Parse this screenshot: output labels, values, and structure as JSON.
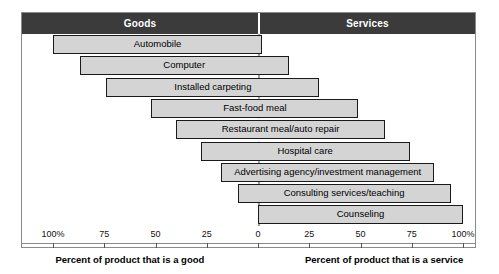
{
  "header": {
    "left_label": "Goods",
    "right_label": "Services"
  },
  "axis": {
    "ticks_left": [
      "100%",
      "75",
      "50",
      "25"
    ],
    "zero": "0",
    "ticks_right": [
      "25",
      "50",
      "75",
      "100%"
    ],
    "caption_left": "Percent of product that is a good",
    "caption_right": "Percent of product that is a service"
  },
  "colors": {
    "header_band": "#3b3b3b",
    "bar_fill": "#d4d4d4",
    "bar_border": "#1a1a1a",
    "zero_line": "#9c9c9c",
    "frame": "#8a8a8a"
  },
  "chart_data": {
    "type": "bar",
    "title": "",
    "subtitle": "",
    "xlabel": "Percent of product that is a good / Percent of product that is a service",
    "ylabel": "",
    "xlim": [
      -100,
      100
    ],
    "grid": false,
    "legend": "none",
    "orientation": "horizontal",
    "note": "Each bar is a product spanning from its percent-good (left of 0) to its percent-service (right of 0).",
    "categories": [
      "Automobile",
      "Computer",
      "Installed carpeting",
      "Fast-food meal",
      "Restaurant meal/auto repair",
      "Hospital care",
      "Advertising agency/investment management",
      "Consulting services/teaching",
      "Counseling"
    ],
    "series": [
      {
        "name": "percent_good",
        "values": [
          100,
          87,
          74,
          52,
          40,
          28,
          18,
          10,
          0
        ]
      },
      {
        "name": "percent_service",
        "values": [
          2,
          15,
          30,
          49,
          62,
          74,
          86,
          94,
          100
        ]
      }
    ],
    "bars": [
      {
        "label": "Automobile",
        "percent_good": 100,
        "percent_service": 2
      },
      {
        "label": "Computer",
        "percent_good": 87,
        "percent_service": 15
      },
      {
        "label": "Installed carpeting",
        "percent_good": 74,
        "percent_service": 30
      },
      {
        "label": "Fast-food meal",
        "percent_good": 52,
        "percent_service": 49
      },
      {
        "label": "Restaurant meal/auto repair",
        "percent_good": 40,
        "percent_service": 62
      },
      {
        "label": "Hospital care",
        "percent_good": 28,
        "percent_service": 74
      },
      {
        "label": "Advertising agency/investment management",
        "percent_good": 18,
        "percent_service": 86
      },
      {
        "label": "Consulting services/teaching",
        "percent_good": 10,
        "percent_service": 94
      },
      {
        "label": "Counseling",
        "percent_good": 0,
        "percent_service": 100
      }
    ]
  }
}
